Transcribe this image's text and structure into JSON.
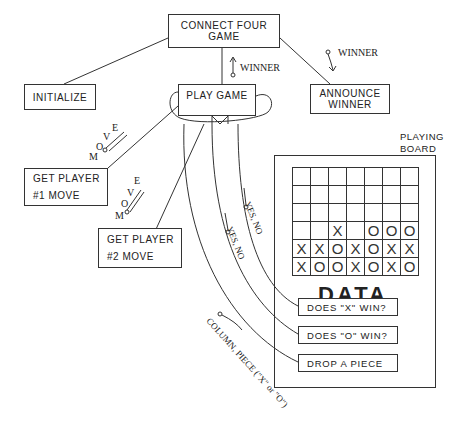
{
  "diagram": {
    "modules": {
      "root": "CONNECT FOUR GAME",
      "initialize": "INITIALIZE",
      "play_game": "PLAY GAME",
      "announce_winner_line1": "ANNOUNCE",
      "announce_winner_line2": "WINNER",
      "get_player1_line1": "GET PLAYER",
      "get_player1_line2": "#1  MOVE",
      "get_player2_line1": "GET PLAYER",
      "get_player2_line2": "#2  MOVE"
    },
    "couples": {
      "winner_up": "WINNER",
      "winner_down": "WINNER",
      "move1": [
        "M",
        "O",
        "V",
        "E"
      ],
      "move2": [
        "M",
        "O",
        "V",
        "E"
      ],
      "yes_no_1": "YES, NO",
      "yes_no_2": "YES, NO",
      "column_piece": "COLUMN, PIECE (\"X\" or \"O\")"
    },
    "playing_board": {
      "label_line1": "PLAYING",
      "label_line2": "BOARD",
      "columns": 7,
      "rows": [
        [
          "",
          "",
          "",
          "",
          "",
          "",
          ""
        ],
        [
          "",
          "",
          "",
          "",
          "",
          "",
          ""
        ],
        [
          "",
          "",
          "",
          "",
          "",
          "",
          ""
        ],
        [
          "",
          "",
          "X",
          "",
          "O",
          "O",
          "O"
        ],
        [
          "X",
          "X",
          "O",
          "X",
          "O",
          "X",
          "X"
        ],
        [
          "X",
          "O",
          "O",
          "X",
          "O",
          "X",
          "O"
        ]
      ],
      "data_title": "DATA",
      "data_items": [
        "DOES \"X\" WIN?",
        "DOES \"O\" WIN?",
        "DROP A PIECE"
      ]
    }
  }
}
